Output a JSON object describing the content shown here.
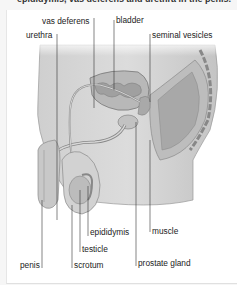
{
  "caption": "epididymis, vas deferens and urethra in the penis.",
  "figure": {
    "labels": {
      "vas_deferens": "vas deferens",
      "bladder": "bladder",
      "urethra": "urethra",
      "seminal_vesicles": "seminal vesicles",
      "epididymis": "epididymis",
      "muscle": "muscle",
      "testicle": "testicle",
      "penis": "penis",
      "scrotum": "scrotum",
      "prostate_gland": "prostate gland"
    }
  }
}
